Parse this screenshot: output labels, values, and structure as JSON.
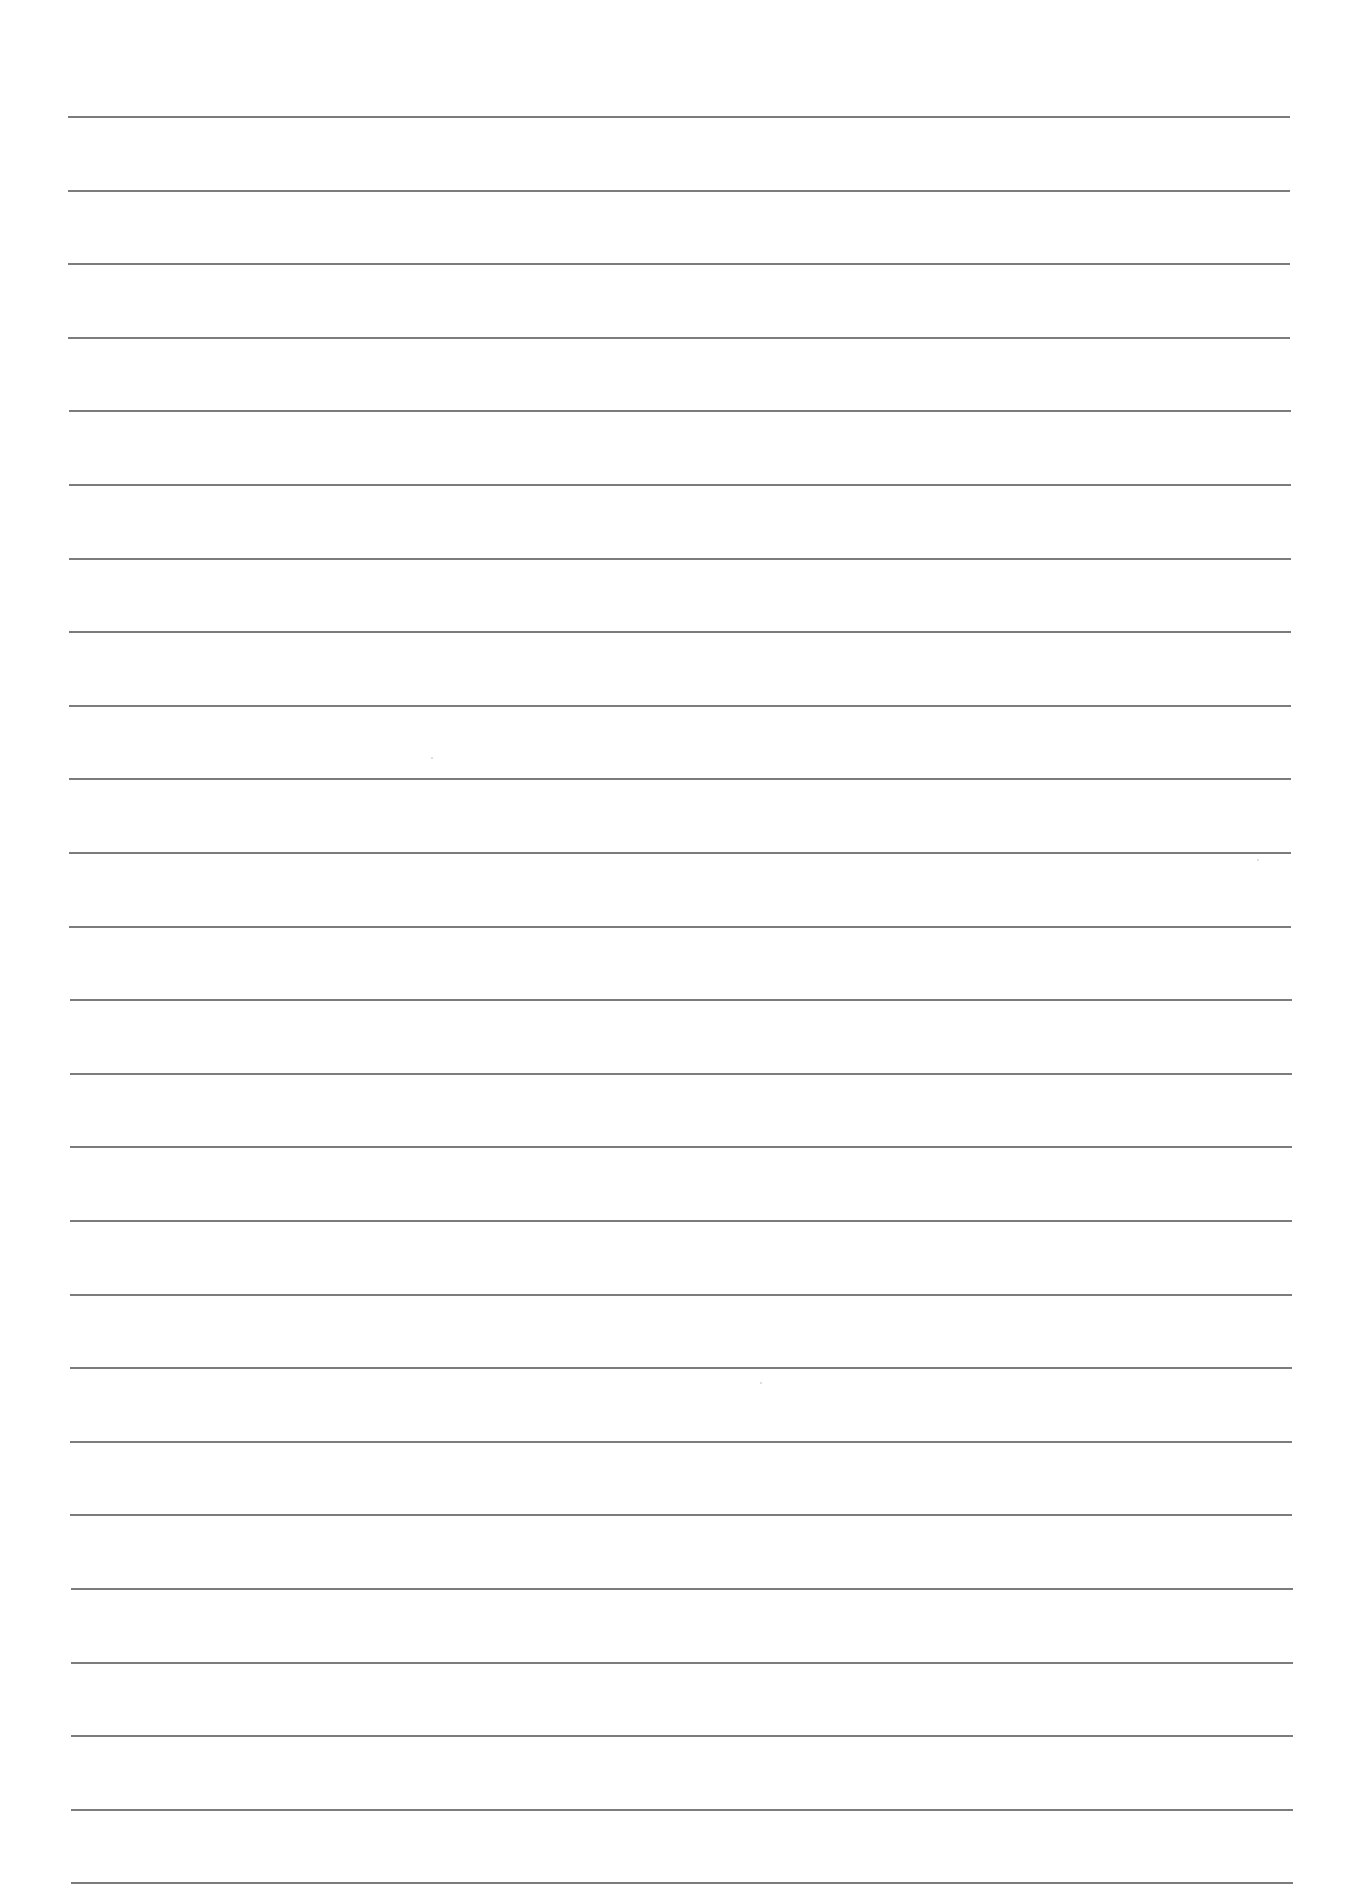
{
  "page": {
    "type": "blank lined paper",
    "background_color": "#ffffff",
    "line_color": "#6e6e6e"
  },
  "rules": {
    "count": 25,
    "first_y": 116,
    "spacing": 73.6,
    "left_x": 68,
    "right_x": 1290,
    "thickness": 2
  },
  "specks": [
    {
      "x": 1257,
      "y": 859
    },
    {
      "x": 760,
      "y": 1382
    },
    {
      "x": 431,
      "y": 757
    }
  ]
}
